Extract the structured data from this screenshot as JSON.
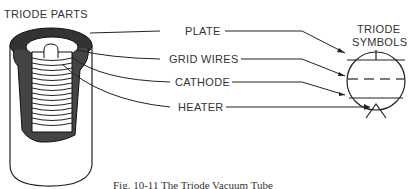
{
  "figure": {
    "left_title": "TRIODE PARTS",
    "right_title_line1": "TRIODE",
    "right_title_line2": "SYMBOLS",
    "labels": {
      "plate": "PLATE",
      "grid_wires": "GRID WIRES",
      "cathode": "CATHODE",
      "heater": "HEATER"
    },
    "caption": "Fig. 10-11 The Triode Vacuum Tube"
  }
}
